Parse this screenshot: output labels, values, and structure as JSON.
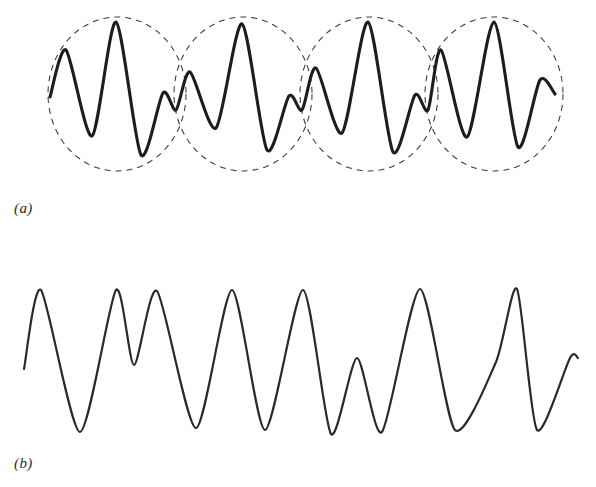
{
  "figure": {
    "background_color": "#ffffff",
    "width": 596,
    "height": 487
  },
  "panels": [
    {
      "id": "panel-a",
      "caption": "(a)",
      "description": "Amplitude-modulated (beat) waveform with dashed elliptical envelopes enclosing each beat group",
      "stroke_color": "#1d1d1d",
      "stroke_width": 3.1,
      "envelope": {
        "shape": "ellipse",
        "count": 4,
        "style": "dashed",
        "stroke_color": "#3a3a3a",
        "stroke_width": 1.05,
        "dash_pattern": "6 5",
        "center_y": 94,
        "radius_x": 69,
        "radius_y": 77,
        "centers_x": [
          117,
          243,
          369,
          494
        ]
      }
    },
    {
      "id": "panel-b",
      "caption": "(b)",
      "description": "Non-modulated irregular waveform of roughly uniform amplitude with one reduced peak near the centre",
      "stroke_color": "#2a2a2a",
      "stroke_width": 2.2
    }
  ],
  "chart_data": [
    {
      "type": "line",
      "id": "panel-a",
      "title": "(a) Amplitude-modulated wave (beats)",
      "xlabel": "",
      "ylabel": "",
      "grid": false,
      "legend": null,
      "xlim": [
        0,
        596
      ],
      "ylim": [
        172,
        17
      ],
      "axis_note": "y axis is in screen pixels and increases downward; y=94 is the zero/mid line",
      "midline_y": 94,
      "series": [
        {
          "name": "modulated-carrier",
          "comment": "Alternating peak/trough turning points of the carrier, traced from the screenshot. Amplitude swells and collapses four times, forming four beat groups.",
          "x": [
            50,
            66,
            92,
            116,
            141,
            163,
            176,
            190,
            216,
            242,
            267,
            289,
            302,
            316,
            342,
            368,
            393,
            415,
            428,
            441,
            467,
            494,
            518,
            540,
            555
          ],
          "y": [
            97,
            50,
            136,
            22,
            155,
            93,
            110,
            72,
            128,
            24,
            150,
            96,
            110,
            68,
            133,
            22,
            152,
            95,
            110,
            50,
            137,
            22,
            147,
            80,
            94
          ],
          "turning_kind": [
            "start",
            "peak",
            "trough",
            "peak",
            "trough",
            "zero",
            "trough",
            "peak",
            "trough",
            "peak",
            "trough",
            "zero",
            "trough",
            "peak",
            "trough",
            "peak",
            "trough",
            "zero",
            "trough",
            "peak",
            "trough",
            "peak",
            "trough",
            "peak",
            "end"
          ]
        },
        {
          "name": "upper-envelope",
          "comment": "Upper halves of the four dashed ellipses",
          "x": [
            48,
            117,
            186,
            174,
            243,
            312,
            300,
            369,
            438,
            425,
            494,
            563
          ],
          "y": [
            94,
            17,
            94,
            94,
            17,
            94,
            94,
            17,
            94,
            94,
            17,
            94
          ]
        },
        {
          "name": "lower-envelope",
          "comment": "Lower halves of the four dashed ellipses",
          "x": [
            48,
            117,
            186,
            174,
            243,
            312,
            300,
            369,
            438,
            425,
            494,
            563
          ],
          "y": [
            94,
            171,
            94,
            94,
            171,
            94,
            94,
            171,
            94,
            94,
            171,
            94
          ]
        }
      ]
    },
    {
      "type": "line",
      "id": "panel-b",
      "title": "(b) Non-modulated wave",
      "xlabel": "",
      "ylabel": "",
      "grid": false,
      "legend": null,
      "xlim": [
        0,
        596
      ],
      "ylim": [
        440,
        285
      ],
      "axis_note": "y axis is in screen pixels and increases downward; y=362 is the approximate mid line",
      "midline_y": 362,
      "series": [
        {
          "name": "unmodulated-wave",
          "comment": "Alternating peak/trough turning points traced from the screenshot. Amplitude is nearly uniform except the reduced peak near x=357.",
          "x": [
            24,
            41,
            80,
            116,
            134,
            157,
            196,
            232,
            265,
            303,
            331,
            357,
            382,
            420,
            455,
            496,
            517,
            537,
            570,
            578
          ],
          "y": [
            369,
            290,
            432,
            290,
            365,
            291,
            428,
            290,
            430,
            290,
            434,
            358,
            432,
            289,
            430,
            362,
            289,
            430,
            358,
            358
          ],
          "turning_kind": [
            "start",
            "peak",
            "trough",
            "peak",
            "trough",
            "peak",
            "trough",
            "peak",
            "trough",
            "peak",
            "trough",
            "small-peak",
            "trough",
            "peak",
            "trough",
            "notch",
            "peak",
            "trough",
            "rise",
            "end"
          ]
        }
      ]
    }
  ]
}
